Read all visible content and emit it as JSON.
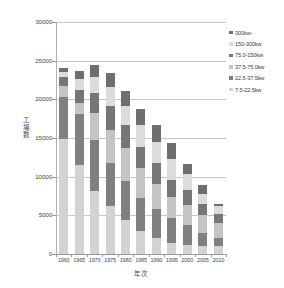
{
  "chart_data": {
    "type": "bar",
    "stacked": true,
    "title": "",
    "xlabel": "年次",
    "ylabel": "工場数",
    "ylim": [
      0,
      30000
    ],
    "ytick_step": 5000,
    "yticks": [
      "0",
      "5000",
      "10000",
      "15000",
      "20000",
      "25000",
      "30000"
    ],
    "grid": true,
    "legend_position": "right",
    "categories": [
      "1960",
      "1965",
      "1970",
      "1975",
      "1980",
      "1985",
      "1990",
      "1995",
      "2000",
      "2005",
      "2010"
    ],
    "series": [
      {
        "name": "7.5-22.5kw",
        "color": "#d3d3d3",
        "values": [
          14900,
          11500,
          8100,
          6200,
          4400,
          2950,
          2100,
          1450,
          1200,
          1000,
          1050
        ]
      },
      {
        "name": "22.5-37.5kw",
        "color": "#808080",
        "values": [
          5400,
          6600,
          6700,
          5600,
          5000,
          4300,
          3750,
          3250,
          2600,
          1750,
          1000
        ]
      },
      {
        "name": "37.5-75.0kw",
        "color": "#c4c4c4",
        "values": [
          1400,
          1450,
          3450,
          4300,
          4250,
          3850,
          3150,
          2700,
          2600,
          2300,
          1900
        ]
      },
      {
        "name": "75.0-150kw",
        "color": "#767676",
        "values": [
          1200,
          1700,
          2600,
          3000,
          3000,
          2800,
          2750,
          2200,
          1900,
          1400,
          1250
        ]
      },
      {
        "name": "150-300kw",
        "color": "#dcdcdc",
        "values": [
          600,
          1350,
          2100,
          2450,
          2500,
          2750,
          2750,
          2650,
          2000,
          1350,
          950
        ]
      },
      {
        "name": "300kw-",
        "color": "#6e6e6e",
        "values": [
          600,
          1050,
          1450,
          1800,
          1950,
          2100,
          2150,
          2100,
          1350,
          1150,
          300
        ]
      }
    ],
    "totals": [
      24100,
      23650,
      24400,
      23350,
      21100,
      18750,
      16650,
      14350,
      11650,
      8950,
      6450
    ],
    "legend_entries": [
      {
        "label": "300kw-",
        "color": "#6e6e6e"
      },
      {
        "label": "150-300kw",
        "color": "#dcdcdc"
      },
      {
        "label": "75.0-150kw",
        "color": "#767676"
      },
      {
        "label": "37.5-75.0kw",
        "color": "#c4c4c4"
      },
      {
        "label": "22.5-37.5kw",
        "color": "#808080"
      },
      {
        "label": "7.5-22.5kw",
        "color": "#d3d3d3"
      }
    ]
  }
}
